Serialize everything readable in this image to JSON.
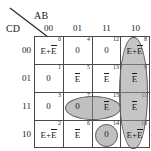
{
  "header": {
    "top_var_label": "AB",
    "side_var_label": "CD"
  },
  "kmap": {
    "type": "karnaugh-map",
    "variables": [
      "A",
      "B",
      "C",
      "D"
    ],
    "column_headers": [
      "00",
      "01",
      "11",
      "10"
    ],
    "row_headers": [
      "00",
      "01",
      "11",
      "10"
    ],
    "cells": [
      {
        "index": "0",
        "value": "E+E",
        "bar_on_second": true,
        "row": 0,
        "col": 0,
        "shaded": false
      },
      {
        "index": "4",
        "value": "0",
        "bar_on_second": false,
        "row": 0,
        "col": 1,
        "shaded": false
      },
      {
        "index": "12",
        "value": "0",
        "bar_on_second": false,
        "row": 0,
        "col": 2,
        "shaded": false
      },
      {
        "index": "8",
        "value": "E+E",
        "bar_on_second": true,
        "row": 0,
        "col": 3,
        "shaded": true
      },
      {
        "index": "1",
        "value": "0",
        "bar_on_second": false,
        "row": 1,
        "col": 0,
        "shaded": false
      },
      {
        "index": "5",
        "value": "E",
        "bar_on_second": true,
        "row": 1,
        "col": 1,
        "shaded": true
      },
      {
        "index": "13",
        "value": "E",
        "bar_on_second": true,
        "row": 1,
        "col": 2,
        "shaded": true
      },
      {
        "index": "9",
        "value": "E",
        "bar_on_second": true,
        "row": 1,
        "col": 3,
        "shaded": true
      },
      {
        "index": "3",
        "value": "0",
        "bar_on_second": false,
        "row": 2,
        "col": 0,
        "shaded": false
      },
      {
        "index": "7",
        "value": "0",
        "bar_on_second": false,
        "row": 2,
        "col": 1,
        "shaded": false
      },
      {
        "index": "15",
        "value": "E",
        "bar_on_second": true,
        "row": 2,
        "col": 2,
        "shaded": true
      },
      {
        "index": "11",
        "value": "E",
        "bar_on_second": true,
        "row": 2,
        "col": 3,
        "shaded": true
      },
      {
        "index": "2",
        "value": "E+E",
        "bar_on_second": true,
        "row": 3,
        "col": 0,
        "shaded": true
      },
      {
        "index": "6",
        "value": "E",
        "bar_on_second": true,
        "row": 3,
        "col": 1,
        "shaded": true
      },
      {
        "index": "14",
        "value": "0",
        "bar_on_second": false,
        "row": 3,
        "col": 2,
        "shaded": false
      },
      {
        "index": "10",
        "value": "E+E",
        "bar_on_second": true,
        "row": 3,
        "col": 3,
        "shaded": true
      }
    ],
    "groups": [
      {
        "name": "group-column-10",
        "shape": "vertical-oval",
        "cells": [
          "8",
          "9",
          "11",
          "10"
        ]
      },
      {
        "name": "group-row-01-middle",
        "shape": "horizontal-oval",
        "cells": [
          "5",
          "13"
        ]
      },
      {
        "name": "group-cell-15",
        "shape": "circle",
        "cells": [
          "15"
        ]
      },
      {
        "name": "group-row-10-left",
        "shape": "horizontal-oval",
        "cells": [
          "2",
          "6"
        ]
      }
    ],
    "colors": {
      "grid_line": "#4a4a4a",
      "blob_fill": "#8c8c8c",
      "blob_stroke": "#5a5a5a",
      "text": "#1a1a1a",
      "background": "#ffffff"
    }
  }
}
